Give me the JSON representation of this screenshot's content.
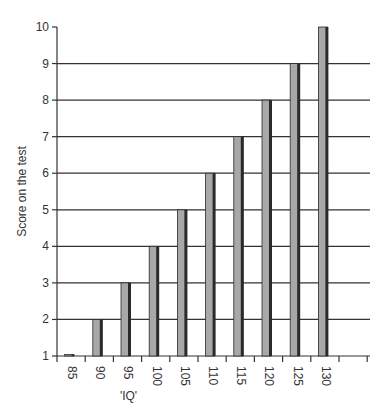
{
  "chart_data": {
    "type": "bar",
    "title": "",
    "xlabel": "'IQ'",
    "ylabel": "Score on the test",
    "categories": [
      "85",
      "90",
      "95",
      "100",
      "105",
      "110",
      "115",
      "120",
      "125",
      "130"
    ],
    "values": [
      1,
      2,
      3,
      4,
      5,
      6,
      7,
      8,
      9,
      10
    ],
    "ylim": [
      1,
      10
    ],
    "yticks": [
      1,
      2,
      3,
      4,
      5,
      6,
      7,
      8,
      9,
      10
    ],
    "grid": true,
    "legend": null
  },
  "colors": {
    "bar_face": "#a8a8a8",
    "bar_side": "#2a2a2a",
    "axis": "#333333",
    "grid": "#333333"
  }
}
